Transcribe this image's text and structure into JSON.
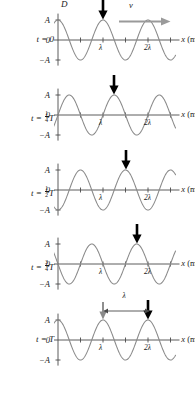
{
  "figure": {
    "title_axis_label": "D",
    "x_axis_label": "x (m)",
    "velocity_label": "v",
    "wavelength_gap_label": "λ",
    "y_ticks": {
      "top": "A",
      "zero": "0",
      "bottom": "−A"
    },
    "x_ticks": [
      {
        "value": 1,
        "label": "λ"
      },
      {
        "value": 2,
        "label": "2λ"
      }
    ],
    "colors": {
      "curve": "#8a8a8a",
      "axis": "#4a4a4a",
      "marker_arrow": "#000000",
      "origin_arrow": "#8a8a8a",
      "velocity_arrow": "#9a9a9a",
      "text": "#1a1a1a",
      "background": "#ffffff"
    },
    "panels": [
      {
        "id": "panel-t0",
        "time_label_prefix": "t",
        "time_label_eq": "=",
        "time_label_value": "0",
        "time_fraction": null,
        "time_unit": "",
        "phase_shift_wavelengths": 0,
        "marker_arrow_x": 1.0,
        "show_velocity_arrow": true,
        "show_origin_arrow": false,
        "show_wavelength_gap": false,
        "show_D_label": true
      },
      {
        "id": "panel-t-quarter",
        "time_label_prefix": "t",
        "time_label_eq": "=",
        "time_label_value": "",
        "time_fraction": {
          "num": "1",
          "den": "4"
        },
        "time_unit": "T",
        "phase_shift_wavelengths": 0.25,
        "marker_arrow_x": 1.25,
        "show_velocity_arrow": false,
        "show_origin_arrow": false,
        "show_wavelength_gap": false,
        "show_D_label": false
      },
      {
        "id": "panel-t-half",
        "time_label_prefix": "t",
        "time_label_eq": "=",
        "time_label_value": "",
        "time_fraction": {
          "num": "1",
          "den": "2"
        },
        "time_unit": "T",
        "phase_shift_wavelengths": 0.5,
        "marker_arrow_x": 1.5,
        "show_velocity_arrow": false,
        "show_origin_arrow": false,
        "show_wavelength_gap": false,
        "show_D_label": false
      },
      {
        "id": "panel-t-three-quarter",
        "time_label_prefix": "t",
        "time_label_eq": "=",
        "time_label_value": "",
        "time_fraction": {
          "num": "3",
          "den": "4"
        },
        "time_unit": "T",
        "phase_shift_wavelengths": 0.75,
        "marker_arrow_x": 1.75,
        "show_velocity_arrow": false,
        "show_origin_arrow": false,
        "show_wavelength_gap": false,
        "show_D_label": false
      },
      {
        "id": "panel-t-full",
        "time_label_prefix": "t",
        "time_label_eq": "=",
        "time_label_value": "T",
        "time_fraction": null,
        "time_unit": "",
        "phase_shift_wavelengths": 1.0,
        "marker_arrow_x": 2.0,
        "show_velocity_arrow": false,
        "show_origin_arrow": true,
        "origin_arrow_x": 1.0,
        "show_wavelength_gap": true,
        "show_D_label": false
      }
    ]
  },
  "chart_data": {
    "type": "line",
    "xlabel": "x (m)",
    "ylabel": "D",
    "xlim": [
      -0.18,
      2.72
    ],
    "ylim": [
      -1.25,
      1.25
    ],
    "grid": false,
    "legend": false,
    "x_tick_values": [
      1,
      2
    ],
    "x_tick_labels": [
      "λ",
      "2λ"
    ],
    "y_tick_values": [
      1,
      0,
      -1
    ],
    "y_tick_labels": [
      "A",
      "0",
      "−A"
    ],
    "wave_form": "D(x,t) = A cos(2π(x/λ − t/T))",
    "series": [
      {
        "name": "t = 0",
        "phase_shift_wavelengths": 0,
        "amplitude": 1,
        "wavelength": 1,
        "crest_positions": [
          0,
          1,
          2
        ],
        "trough_positions": [
          0.5,
          1.5,
          2.5
        ]
      },
      {
        "name": "t = T/4",
        "phase_shift_wavelengths": 0.25,
        "amplitude": 1,
        "wavelength": 1,
        "crest_positions": [
          0.25,
          1.25,
          2.25
        ],
        "trough_positions": [
          0.75,
          1.75,
          2.75
        ]
      },
      {
        "name": "t = T/2",
        "phase_shift_wavelengths": 0.5,
        "amplitude": 1,
        "wavelength": 1,
        "crest_positions": [
          0.5,
          1.5,
          2.5
        ],
        "trough_positions": [
          0,
          1,
          2
        ]
      },
      {
        "name": "t = 3T/4",
        "phase_shift_wavelengths": 0.75,
        "amplitude": 1,
        "wavelength": 1,
        "crest_positions": [
          0.75,
          1.75,
          2.75
        ],
        "trough_positions": [
          0.25,
          1.25,
          2.25
        ]
      },
      {
        "name": "t = T",
        "phase_shift_wavelengths": 1.0,
        "amplitude": 1,
        "wavelength": 1,
        "crest_positions": [
          0,
          1,
          2
        ],
        "trough_positions": [
          0.5,
          1.5,
          2.5
        ]
      }
    ],
    "annotations": [
      {
        "name": "velocity-arrow",
        "label": "v",
        "direction": "right",
        "panel": "t = 0"
      },
      {
        "name": "crest-marker",
        "label": "",
        "x_positions_by_panel": [
          1.0,
          1.25,
          1.5,
          1.75,
          2.0
        ]
      },
      {
        "name": "wavelength-span",
        "label": "λ",
        "from_x": 1.0,
        "to_x": 2.0,
        "panel": "t = T"
      }
    ]
  }
}
